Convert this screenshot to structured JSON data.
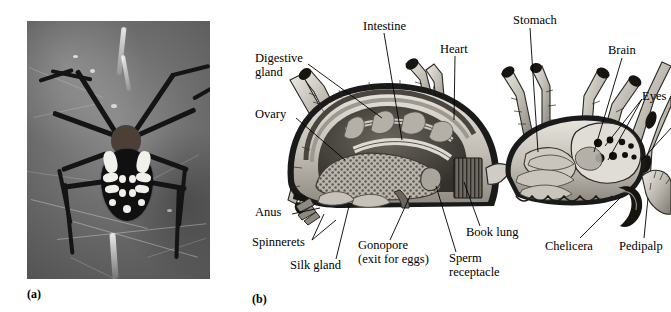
{
  "figure": {
    "panels": [
      {
        "id": "a",
        "caption": "(a)",
        "type": "photograph",
        "subject": "garden spider on web"
      },
      {
        "id": "b",
        "caption": "(b)",
        "type": "anatomical-cutaway-diagram",
        "subject": "spider internal anatomy"
      }
    ]
  },
  "diagram": {
    "labels": [
      {
        "key": "digestive_gland",
        "text": "Digestive\ngland",
        "x": 5,
        "y": 58,
        "align": "left"
      },
      {
        "key": "ovary",
        "text": "Ovary",
        "x": 5,
        "y": 115,
        "align": "left"
      },
      {
        "key": "anus",
        "text": "Anus",
        "x": 5,
        "y": 212,
        "align": "left"
      },
      {
        "key": "spinnerets",
        "text": "Spinnerets",
        "x": 2,
        "y": 242,
        "align": "left"
      },
      {
        "key": "silk_gland",
        "text": "Silk gland",
        "x": 40,
        "y": 264,
        "align": "left"
      },
      {
        "key": "intestine",
        "text": "Intestine",
        "x": 113,
        "y": 22,
        "align": "left"
      },
      {
        "key": "heart",
        "text": "Heart",
        "x": 192,
        "y": 45,
        "align": "left"
      },
      {
        "key": "stomach",
        "text": "Stomach",
        "x": 266,
        "y": 16,
        "align": "left"
      },
      {
        "key": "brain",
        "text": "Brain",
        "x": 359,
        "y": 46,
        "align": "left"
      },
      {
        "key": "eyes",
        "text": "Eyes",
        "x": 394,
        "y": 92,
        "align": "left"
      },
      {
        "key": "gonopore",
        "text": "Gonopore\n(exit for eggs)",
        "x": 110,
        "y": 243,
        "align": "left"
      },
      {
        "key": "sperm_receptacle",
        "text": "Sperm\nreceptacle",
        "x": 200,
        "y": 255,
        "align": "left"
      },
      {
        "key": "book_lung",
        "text": "Book lung",
        "x": 216,
        "y": 229,
        "align": "left"
      },
      {
        "key": "chelicera",
        "text": "Chelicera",
        "x": 298,
        "y": 243,
        "align": "left"
      },
      {
        "key": "pedipalp",
        "text": "Pedipalp",
        "x": 370,
        "y": 243,
        "align": "left"
      }
    ],
    "leaders": [
      {
        "key": "digestive_gland",
        "points": "58,64 132,118"
      },
      {
        "key": "ovary",
        "points": "46,118 95,160"
      },
      {
        "key": "anus",
        "points": "42,214 70,208"
      },
      {
        "key": "spinnerets",
        "points": "62,240 76,219"
      },
      {
        "key": "spinnerets2",
        "points": "62,240 86,222"
      },
      {
        "key": "silk_gland",
        "points": "86,259 99,212"
      },
      {
        "key": "intestine",
        "points": "134,33 152,135"
      },
      {
        "key": "heart",
        "points": "205,56 204,112"
      },
      {
        "key": "stomach",
        "points": "280,28 284,145"
      },
      {
        "key": "brain",
        "points": "372,58 396,145"
      },
      {
        "key": "eyes",
        "points": "392,99 358,148"
      },
      {
        "key": "eyes2",
        "points": "392,99 362,160"
      },
      {
        "key": "gonopore",
        "points": "140,240 167,198"
      },
      {
        "key": "sperm_receptacle",
        "points": "204,252 190,190"
      },
      {
        "key": "book_lung",
        "points": "230,226 215,184"
      },
      {
        "key": "chelicera",
        "points": "330,238 371,184"
      },
      {
        "key": "pedipalp",
        "points": "392,238 392,190"
      }
    ],
    "colors": {
      "line": "#000000",
      "text": "#000000",
      "body_light": "#d9d6cf",
      "body_mid": "#9b968c",
      "body_dark": "#55514a",
      "outline": "#1a1a1a"
    }
  },
  "photo": {
    "colors": {
      "background_light": "#8c8c8c",
      "background_mid": "#6f6f6f",
      "background_dark": "#545454",
      "spider_body": "#101010",
      "spider_markings": "#f2f0ea",
      "silk": "#ffffff"
    }
  }
}
